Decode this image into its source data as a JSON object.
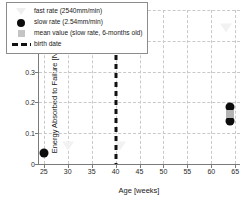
{
  "chart_data": {
    "type": "scatter",
    "title": "",
    "xlabel": "Age [weeks]",
    "ylabel_text": "Energy Absorbed to Failure [Nmm/mm",
    "ylabel_sup": "3",
    "ylabel_tail": "]",
    "xlim": [
      24,
      66
    ],
    "ylim": [
      0,
      0.5
    ],
    "grid": true,
    "legend_position": "upper-left-inside",
    "xticks": [
      25,
      30,
      35,
      40,
      45,
      50,
      55,
      60,
      65
    ],
    "xtick_labels": [
      "25",
      "30",
      "35",
      "40",
      "45",
      "50",
      "55",
      "60",
      "65"
    ],
    "yticks": [
      0,
      0.1,
      0.2,
      0.3,
      0.4,
      0.5
    ],
    "ytick_labels": [
      "0",
      "0.1",
      "0.2",
      "0.3",
      "0.4",
      "0.5"
    ],
    "series": [
      {
        "name": "fast rate (2540mm/min)",
        "marker": "triangle-down",
        "color": "#f2f2f2",
        "points": [
          {
            "x": 30,
            "y": 0.06
          },
          {
            "x": 41,
            "y": 0.06
          },
          {
            "x": 63,
            "y": 0.44
          }
        ]
      },
      {
        "name": "slow rate (2.54mm/min)",
        "marker": "circle",
        "color": "#0d0d0d",
        "points": [
          {
            "x": 25,
            "y": 0.035
          },
          {
            "x": 64,
            "y": 0.185
          },
          {
            "x": 64,
            "y": 0.138
          }
        ]
      },
      {
        "name": "mean value (slow rate, 6-months old)",
        "marker": "square",
        "color": "#b4b4b4",
        "points": [
          {
            "x": 64,
            "y": 0.162
          }
        ]
      },
      {
        "name": "birth date",
        "marker": "dashed-vline",
        "color": "#111111",
        "vline_x": 40
      }
    ]
  },
  "legend": {
    "entries": [
      {
        "label": "fast rate (2540mm/min)",
        "swatch": "triangle-down-icon"
      },
      {
        "label": "slow rate (2.54mm/min)",
        "swatch": "circle-icon"
      },
      {
        "label": "mean value (slow rate, 6-months old)",
        "swatch": "square-icon"
      },
      {
        "label": "birth date",
        "swatch": "dashed-line-icon"
      }
    ]
  }
}
